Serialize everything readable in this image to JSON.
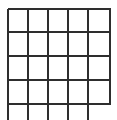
{
  "canvas": {
    "width": 117,
    "height": 120,
    "background_color": "#ffffff"
  },
  "figure": {
    "name": "grid-lattice",
    "line_color": "#2e2e2e",
    "line_width": 2,
    "rows": 4,
    "columns": 5,
    "cell_width": 20,
    "cell_height": 24
  },
  "chart_data": {
    "type": "table",
    "title": "",
    "subtitle": "",
    "xlabel": "",
    "ylabel": "",
    "grid": true,
    "legend": "none",
    "vertical_lines_x": [
      8,
      28,
      48,
      68,
      88,
      110
    ],
    "horizontal_lines_y": [
      9,
      32,
      56,
      80,
      104
    ],
    "vertical_line_extents": [
      {
        "x": 8,
        "y1": 9,
        "y2": 120
      },
      {
        "x": 28,
        "y1": 9,
        "y2": 120
      },
      {
        "x": 48,
        "y1": 9,
        "y2": 120
      },
      {
        "x": 68,
        "y1": 9,
        "y2": 120
      },
      {
        "x": 88,
        "y1": 9,
        "y2": 120
      },
      {
        "x": 110,
        "y1": 9,
        "y2": 104
      }
    ],
    "horizontal_line_extents": [
      {
        "y": 9,
        "x1": 8,
        "x2": 111
      },
      {
        "y": 32,
        "x1": 8,
        "x2": 111
      },
      {
        "y": 56,
        "x1": 8,
        "x2": 111
      },
      {
        "y": 80,
        "x1": 8,
        "x2": 111
      },
      {
        "y": 104,
        "x1": 8,
        "x2": 111
      }
    ],
    "categories": [
      "col-1",
      "col-2",
      "col-3",
      "col-4",
      "col-5"
    ],
    "values": [
      0,
      0,
      0,
      0,
      0
    ]
  }
}
